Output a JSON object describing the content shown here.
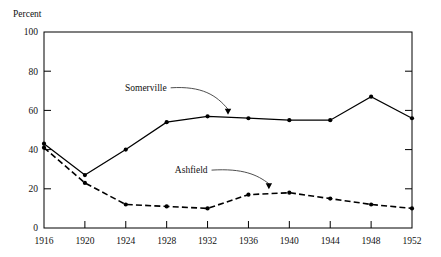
{
  "chart_data": {
    "type": "line",
    "title": "",
    "xlabel": "",
    "ylabel": "Percent",
    "x": [
      1916,
      1920,
      1924,
      1928,
      1932,
      1936,
      1940,
      1944,
      1948,
      1952
    ],
    "xtick_labels": [
      "1916",
      "1920",
      "1924",
      "1928",
      "1932",
      "1936",
      "1940",
      "1944",
      "1948",
      "1952"
    ],
    "ytick_labels": [
      "0",
      "20",
      "40",
      "60",
      "80",
      "100"
    ],
    "yticks": [
      0,
      20,
      40,
      60,
      80,
      100
    ],
    "xlim": [
      1916,
      1952
    ],
    "ylim": [
      0,
      100
    ],
    "grid": false,
    "legend_position": "inline-annotations",
    "series": [
      {
        "name": "Somerville",
        "style": "solid",
        "marker": "circle",
        "color": "#000000",
        "values": [
          43,
          27,
          40,
          54,
          57,
          56,
          55,
          55,
          67,
          56
        ]
      },
      {
        "name": "Ashfield",
        "style": "dashed",
        "marker": "circle",
        "color": "#000000",
        "values": [
          41,
          23,
          12,
          11,
          10,
          17,
          18,
          15,
          12,
          10
        ]
      }
    ],
    "annotations": [
      {
        "text": "Somerville",
        "points_to_x": 1934,
        "points_to_y": 57,
        "label_x": 1928,
        "label_y": 70
      },
      {
        "text": "Ashfield",
        "points_to_x": 1938,
        "points_to_y": 19,
        "label_x": 1932,
        "label_y": 28
      }
    ]
  },
  "axis": {
    "y_title": "Percent"
  }
}
